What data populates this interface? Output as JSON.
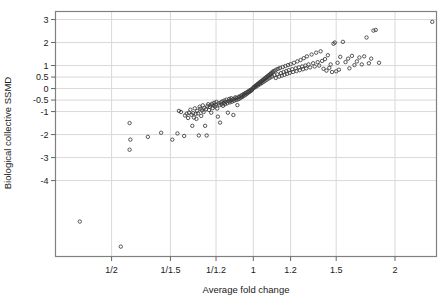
{
  "chart_data": {
    "type": "scatter",
    "title": "",
    "xlabel": "Average fold change",
    "ylabel": "Biological collective SSMD",
    "grid": true,
    "legend": "none",
    "marker": "open-circle",
    "marker_color": "#3a3a3a",
    "frame_color": "#808080",
    "grid_color": "#d9d9d9",
    "x_scale": "log",
    "xtick_labels": [
      "1/2",
      "1/1.5",
      "1/1.2",
      "1",
      "1.2",
      "1.5",
      "2"
    ],
    "xtick_values": [
      0.5,
      0.6667,
      0.8333,
      1,
      1.2,
      1.5,
      2
    ],
    "xlim": [
      0.38,
      2.45
    ],
    "ytick_labels": [
      "3",
      "2",
      "1",
      "0.5",
      "0",
      "-0.5",
      "-1",
      "-2",
      "-3",
      "-4"
    ],
    "ytick_values": [
      3,
      2,
      1,
      0.5,
      0,
      -0.5,
      -1,
      -2,
      -3,
      -4
    ],
    "ylim": [
      -7.3,
      3.35
    ],
    "points": [
      [
        0.428,
        -5.78
      ],
      [
        0.523,
        -6.87
      ],
      [
        0.546,
        -1.5
      ],
      [
        0.548,
        -2.22
      ],
      [
        0.546,
        -2.66
      ],
      [
        0.597,
        -2.1
      ],
      [
        0.637,
        -1.92
      ],
      [
        0.673,
        -2.22
      ],
      [
        0.69,
        -1.95
      ],
      [
        0.695,
        -0.97
      ],
      [
        0.702,
        -1.02
      ],
      [
        0.713,
        -2.06
      ],
      [
        0.716,
        -1.17
      ],
      [
        0.722,
        -1.09
      ],
      [
        0.727,
        -1.28
      ],
      [
        0.73,
        -1.05
      ],
      [
        0.735,
        -0.92
      ],
      [
        0.739,
        -1.14
      ],
      [
        0.742,
        -1.62
      ],
      [
        0.745,
        -1.07
      ],
      [
        0.748,
        -1.26
      ],
      [
        0.751,
        -0.86
      ],
      [
        0.754,
        -1.1
      ],
      [
        0.757,
        -1.32
      ],
      [
        0.76,
        -0.97
      ],
      [
        0.763,
        -1.08
      ],
      [
        0.766,
        -2.04
      ],
      [
        0.769,
        -0.79
      ],
      [
        0.772,
        -0.88
      ],
      [
        0.775,
        -1.19
      ],
      [
        0.778,
        -0.95
      ],
      [
        0.781,
        -0.73
      ],
      [
        0.784,
        -1.02
      ],
      [
        0.787,
        -0.84
      ],
      [
        0.79,
        -1.62
      ],
      [
        0.793,
        -0.9
      ],
      [
        0.796,
        -2.04
      ],
      [
        0.799,
        -0.76
      ],
      [
        0.802,
        -0.68
      ],
      [
        0.805,
        -0.93
      ],
      [
        0.808,
        -0.8
      ],
      [
        0.811,
        -0.72
      ],
      [
        0.814,
        -1.05
      ],
      [
        0.817,
        -0.66
      ],
      [
        0.82,
        -0.85
      ],
      [
        0.823,
        -0.74
      ],
      [
        0.826,
        -0.62
      ],
      [
        0.829,
        -0.78
      ],
      [
        0.832,
        -0.7
      ],
      [
        0.835,
        -0.58
      ],
      [
        0.838,
        -0.87
      ],
      [
        0.841,
        -1.22
      ],
      [
        0.844,
        -0.64
      ],
      [
        0.847,
        -0.72
      ],
      [
        0.85,
        -1.48
      ],
      [
        0.853,
        -0.6
      ],
      [
        0.856,
        -0.69
      ],
      [
        0.859,
        -0.56
      ],
      [
        0.862,
        -0.75
      ],
      [
        0.865,
        -0.63
      ],
      [
        0.868,
        -0.52
      ],
      [
        0.871,
        -0.68
      ],
      [
        0.874,
        -0.58
      ],
      [
        0.877,
        -0.48
      ],
      [
        0.88,
        -0.64
      ],
      [
        0.883,
        -1.05
      ],
      [
        0.886,
        -0.55
      ],
      [
        0.889,
        -0.45
      ],
      [
        0.892,
        -0.6
      ],
      [
        0.895,
        -0.5
      ],
      [
        0.898,
        -0.42
      ],
      [
        0.901,
        -0.57
      ],
      [
        0.904,
        -0.47
      ],
      [
        0.907,
        -1.15
      ],
      [
        0.91,
        -0.53
      ],
      [
        0.913,
        -0.44
      ],
      [
        0.916,
        -0.38
      ],
      [
        0.919,
        -0.5
      ],
      [
        0.922,
        -0.41
      ],
      [
        0.925,
        -0.72
      ],
      [
        0.928,
        -0.47
      ],
      [
        0.931,
        -0.36
      ],
      [
        0.934,
        -0.44
      ],
      [
        0.937,
        -0.34
      ],
      [
        0.94,
        -0.4
      ],
      [
        0.943,
        -0.3
      ],
      [
        0.946,
        -0.37
      ],
      [
        0.949,
        -0.27
      ],
      [
        0.952,
        -0.33
      ],
      [
        0.955,
        -0.24
      ],
      [
        0.958,
        -0.3
      ],
      [
        0.961,
        -0.2
      ],
      [
        0.964,
        -0.26
      ],
      [
        0.967,
        -0.17
      ],
      [
        0.97,
        -0.22
      ],
      [
        0.973,
        -0.14
      ],
      [
        0.976,
        -0.18
      ],
      [
        0.979,
        -0.1
      ],
      [
        0.982,
        -0.14
      ],
      [
        0.985,
        -0.07
      ],
      [
        0.988,
        -0.1
      ],
      [
        0.991,
        -0.03
      ],
      [
        0.994,
        -0.06
      ],
      [
        0.997,
        0.0
      ],
      [
        1.0,
        0.03
      ],
      [
        1.003,
        0.07
      ],
      [
        1.006,
        0.04
      ],
      [
        1.009,
        0.1
      ],
      [
        1.012,
        0.13
      ],
      [
        1.015,
        0.09
      ],
      [
        1.018,
        0.16
      ],
      [
        1.021,
        0.2
      ],
      [
        1.024,
        0.14
      ],
      [
        1.027,
        0.22
      ],
      [
        1.03,
        0.26
      ],
      [
        1.033,
        0.19
      ],
      [
        1.036,
        0.28
      ],
      [
        1.039,
        0.32
      ],
      [
        1.042,
        0.24
      ],
      [
        1.045,
        0.34
      ],
      [
        1.048,
        0.38
      ],
      [
        1.051,
        0.29
      ],
      [
        1.054,
        0.4
      ],
      [
        1.057,
        0.44
      ],
      [
        1.06,
        0.34
      ],
      [
        1.063,
        0.46
      ],
      [
        1.066,
        0.5
      ],
      [
        1.069,
        0.39
      ],
      [
        1.072,
        0.52
      ],
      [
        1.075,
        0.56
      ],
      [
        1.078,
        0.44
      ],
      [
        1.081,
        0.58
      ],
      [
        1.084,
        0.62
      ],
      [
        1.087,
        0.48
      ],
      [
        1.09,
        0.64
      ],
      [
        1.093,
        0.69
      ],
      [
        1.096,
        0.53
      ],
      [
        1.1,
        0.71
      ],
      [
        1.104,
        0.76
      ],
      [
        1.108,
        0.58
      ],
      [
        1.112,
        0.78
      ],
      [
        1.116,
        0.46
      ],
      [
        1.12,
        0.83
      ],
      [
        1.125,
        0.62
      ],
      [
        1.13,
        0.86
      ],
      [
        1.135,
        0.52
      ],
      [
        1.14,
        0.9
      ],
      [
        1.145,
        0.67
      ],
      [
        1.15,
        0.56
      ],
      [
        1.155,
        0.94
      ],
      [
        1.16,
        0.72
      ],
      [
        1.165,
        0.6
      ],
      [
        1.17,
        0.98
      ],
      [
        1.175,
        0.76
      ],
      [
        1.18,
        0.64
      ],
      [
        1.185,
        1.02
      ],
      [
        1.19,
        0.8
      ],
      [
        1.195,
        0.68
      ],
      [
        1.2,
        1.06
      ],
      [
        1.21,
        0.84
      ],
      [
        1.215,
        0.72
      ],
      [
        1.22,
        1.12
      ],
      [
        1.23,
        0.88
      ],
      [
        1.235,
        0.76
      ],
      [
        1.24,
        1.18
      ],
      [
        1.25,
        0.92
      ],
      [
        1.255,
        0.8
      ],
      [
        1.26,
        1.24
      ],
      [
        1.27,
        0.96
      ],
      [
        1.275,
        0.84
      ],
      [
        1.28,
        1.32
      ],
      [
        1.29,
        1.0
      ],
      [
        1.295,
        0.88
      ],
      [
        1.3,
        1.4
      ],
      [
        1.31,
        1.05
      ],
      [
        1.32,
        0.92
      ],
      [
        1.33,
        1.48
      ],
      [
        1.34,
        1.1
      ],
      [
        1.35,
        0.96
      ],
      [
        1.36,
        1.56
      ],
      [
        1.37,
        1.15
      ],
      [
        1.38,
        1.0
      ],
      [
        1.39,
        1.62
      ],
      [
        1.4,
        1.2
      ],
      [
        1.41,
        0.86
      ],
      [
        1.42,
        1.28
      ],
      [
        1.43,
        0.78
      ],
      [
        1.44,
        1.45
      ],
      [
        1.45,
        0.9
      ],
      [
        1.46,
        1.05
      ],
      [
        1.47,
        0.72
      ],
      [
        1.48,
        1.95
      ],
      [
        1.49,
        2.0
      ],
      [
        1.5,
        0.75
      ],
      [
        1.51,
        1.12
      ],
      [
        1.52,
        0.82
      ],
      [
        1.53,
        1.38
      ],
      [
        1.55,
        2.03
      ],
      [
        1.57,
        1.15
      ],
      [
        1.59,
        1.3
      ],
      [
        1.6,
        0.88
      ],
      [
        1.62,
        1.42
      ],
      [
        1.64,
        1.02
      ],
      [
        1.66,
        1.18
      ],
      [
        1.68,
        1.35
      ],
      [
        1.7,
        1.05
      ],
      [
        1.72,
        1.4
      ],
      [
        1.74,
        2.22
      ],
      [
        1.76,
        1.1
      ],
      [
        1.78,
        1.3
      ],
      [
        1.8,
        2.52
      ],
      [
        1.82,
        2.55
      ],
      [
        1.85,
        1.12
      ],
      [
        2.4,
        2.9
      ]
    ]
  }
}
